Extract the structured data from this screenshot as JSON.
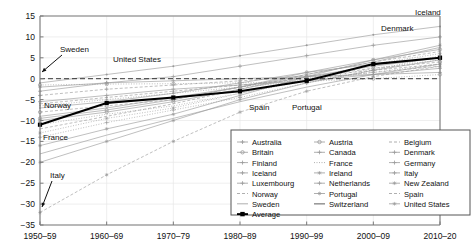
{
  "chart_data": {
    "type": "line",
    "title": "",
    "xlabel": "",
    "ylabel": "",
    "categories": [
      "1950-59",
      "1960-69",
      "1970-79",
      "1980-89",
      "1990-99",
      "2000-09",
      "2010-20"
    ],
    "xtick_labels": [
      "1950–59",
      "1960–69",
      "1970–79",
      "1980–89",
      "1990–99",
      "2000–09",
      "2010–20"
    ],
    "ytick_labels": [
      "15",
      "10",
      "5",
      "0",
      "-5",
      "-10",
      "-15",
      "-20",
      "-25",
      "-30",
      "-35"
    ],
    "ytick_values": [
      15,
      10,
      5,
      0,
      -5,
      -10,
      -15,
      -20,
      -25,
      -30,
      -35
    ],
    "ylim": [
      -35,
      15
    ],
    "grid": true,
    "zero_line": true,
    "legend_position": "lower-right",
    "annotations": [
      {
        "text": "Sweden",
        "x": 60,
        "y": 52,
        "arrow_to_x": 42,
        "arrow_to_y": 72
      },
      {
        "text": "United States",
        "x": 113,
        "y": 62
      },
      {
        "text": "Norway",
        "x": 44,
        "y": 108
      },
      {
        "text": "France",
        "x": 43,
        "y": 140
      },
      {
        "text": "Italy",
        "x": 50,
        "y": 178,
        "arrow_to_x": 42,
        "arrow_to_y": 207
      },
      {
        "text": "Spain",
        "x": 249,
        "y": 110
      },
      {
        "text": "Portugal",
        "x": 292,
        "y": 110
      },
      {
        "text": "Denmark",
        "x": 381,
        "y": 31
      },
      {
        "text": "Iceland",
        "x": 415,
        "y": 15
      }
    ],
    "series": [
      {
        "name": "Australia",
        "values": [
          -5.5,
          -4.0,
          -2.5,
          -1.5,
          -0.5,
          1.0,
          2.5
        ]
      },
      {
        "name": "Britain",
        "values": [
          -8.0,
          -6.5,
          -5.0,
          -2.0,
          0.5,
          2.5,
          4.0
        ]
      },
      {
        "name": "Finland",
        "values": [
          -13.0,
          -9.5,
          -7.0,
          -3.5,
          0.0,
          3.5,
          6.0
        ]
      },
      {
        "name": "Iceland",
        "values": [
          -1.0,
          1.0,
          3.0,
          5.5,
          8.0,
          10.5,
          12.5
        ]
      },
      {
        "name": "Luxembourg",
        "values": [
          -9.0,
          -7.0,
          -4.5,
          -2.0,
          1.0,
          4.0,
          7.5
        ]
      },
      {
        "name": "Norway",
        "values": [
          -4.0,
          -2.5,
          -1.5,
          -0.5,
          0.5,
          2.0,
          3.5
        ]
      },
      {
        "name": "Sweden",
        "values": [
          -1.5,
          -1.3,
          -1.2,
          -1.0,
          -0.6,
          0.0,
          1.0
        ]
      },
      {
        "name": "Austria",
        "values": [
          -16.0,
          -12.0,
          -8.5,
          -4.0,
          0.5,
          4.5,
          8.0
        ]
      },
      {
        "name": "Canada",
        "values": [
          -7.0,
          -5.5,
          -3.5,
          -1.0,
          1.5,
          3.5,
          5.0
        ]
      },
      {
        "name": "France",
        "values": [
          -12.0,
          -9.0,
          -6.0,
          -2.5,
          1.0,
          4.0,
          6.5
        ]
      },
      {
        "name": "Ireland",
        "values": [
          -14.0,
          -10.5,
          -7.5,
          -4.5,
          -1.0,
          2.0,
          5.5
        ]
      },
      {
        "name": "Netherlands",
        "values": [
          -10.0,
          -8.0,
          -5.5,
          -2.5,
          0.5,
          3.0,
          5.0
        ]
      },
      {
        "name": "Portugal",
        "values": [
          -20.0,
          -15.0,
          -10.0,
          -5.0,
          -1.0,
          2.0,
          4.5
        ]
      },
      {
        "name": "Switzerland",
        "values": [
          -6.0,
          -4.5,
          -3.0,
          -1.5,
          0.0,
          1.5,
          3.0
        ]
      },
      {
        "name": "Belgium",
        "values": [
          -11.0,
          -8.5,
          -6.5,
          -3.5,
          -0.5,
          2.5,
          4.5
        ]
      },
      {
        "name": "Denmark",
        "values": [
          -3.0,
          -1.0,
          0.5,
          3.0,
          5.5,
          8.0,
          10.0
        ]
      },
      {
        "name": "Germany",
        "values": [
          -9.5,
          -7.5,
          -5.0,
          -2.0,
          1.5,
          4.5,
          7.0
        ]
      },
      {
        "name": "Italy",
        "values": [
          -32.0,
          -23.0,
          -15.0,
          -8.0,
          -3.0,
          0.5,
          3.0
        ]
      },
      {
        "name": "New Zealand",
        "values": [
          -6.5,
          -5.0,
          -3.5,
          -2.0,
          -0.5,
          1.5,
          3.5
        ]
      },
      {
        "name": "Spain",
        "values": [
          -18.0,
          -13.5,
          -9.5,
          -5.5,
          -2.0,
          1.0,
          3.5
        ]
      },
      {
        "name": "United States",
        "values": [
          -2.0,
          -1.0,
          -0.5,
          0.0,
          0.5,
          1.0,
          1.5
        ]
      },
      {
        "name": "Average",
        "values": [
          -11.0,
          -5.8,
          -4.5,
          -3.0,
          -0.5,
          3.5,
          5.0
        ],
        "highlight": true
      }
    ]
  },
  "legend": {
    "columns": [
      [
        {
          "label": "Australia",
          "marker": "plus-line"
        },
        {
          "label": "Britain",
          "marker": "circle-line"
        },
        {
          "label": "Finland",
          "marker": "plus-line"
        },
        {
          "label": "Iceland",
          "marker": "plus-line"
        },
        {
          "label": "Luxembourg",
          "marker": "plus-line"
        },
        {
          "label": "Norway",
          "marker": "dash-line"
        },
        {
          "label": "Sweden",
          "marker": "solid-line"
        },
        {
          "label": "Average",
          "marker": "bold-square"
        }
      ],
      [
        {
          "label": "Austria",
          "marker": "circle-line"
        },
        {
          "label": "Canada",
          "marker": "plus-line"
        },
        {
          "label": "France",
          "marker": "dot-line"
        },
        {
          "label": "Ireland",
          "marker": "star-line"
        },
        {
          "label": "Netherlands",
          "marker": "plus-line"
        },
        {
          "label": "Portugal",
          "marker": "star-line"
        },
        {
          "label": "Switzerland",
          "marker": "thick-line"
        }
      ],
      [
        {
          "label": "Belgium",
          "marker": "dash-line"
        },
        {
          "label": "Denmark",
          "marker": "plus-line"
        },
        {
          "label": "Germany",
          "marker": "plus-line"
        },
        {
          "label": "Italy",
          "marker": "plus-line"
        },
        {
          "label": "New Zealand",
          "marker": "star-line"
        },
        {
          "label": "Spain",
          "marker": "dash-line"
        },
        {
          "label": "United States",
          "marker": "star-line"
        }
      ]
    ]
  },
  "colors": {
    "background": "#ffffff",
    "axis": "#7a7a7a",
    "grid": "#e8e8e8",
    "series": "#9a9a9a",
    "highlight": "#000000",
    "text": "#111111"
  }
}
